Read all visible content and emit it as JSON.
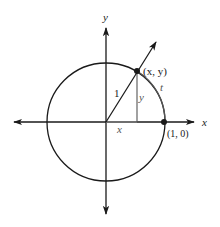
{
  "diagram": {
    "type": "unit-circle",
    "colors": {
      "stroke": "#1a1a1a",
      "guide": "#555555",
      "background": "#ffffff"
    },
    "axes": {
      "x_label": "x",
      "y_label": "y"
    },
    "labels": {
      "point_xy": "(x, y)",
      "point_one_zero": "(1, 0)",
      "radius": "1",
      "vertical_leg": "y",
      "horizontal_leg": "x",
      "arc": "t"
    }
  }
}
